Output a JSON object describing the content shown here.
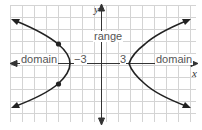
{
  "diagram": {
    "axes": {
      "x_label": "x",
      "y_label": "y"
    },
    "tick_labels": {
      "left_vertex": "−3",
      "right_vertex": "3"
    },
    "annotations": {
      "range": "range",
      "domain_left": "domain",
      "domain_right": "domain"
    },
    "colors": {
      "grid": "#d0d0d0",
      "axis": "#333333",
      "curve": "#222222",
      "text": "#555555"
    }
  }
}
